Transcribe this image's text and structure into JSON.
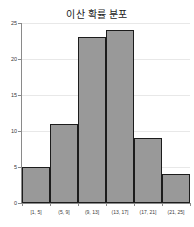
{
  "chart_data": {
    "type": "bar",
    "title": "이산 확률 분포",
    "xlabel": "",
    "ylabel": "",
    "categories": [
      "[1, 5]",
      "(5, 9]",
      "(9, 13]",
      "(13, 17]",
      "(17, 21]",
      "(21, 25]"
    ],
    "values": [
      5,
      11,
      23,
      24,
      9,
      4
    ],
    "ylim": [
      0,
      25
    ],
    "yticks": [
      0,
      5,
      10,
      15,
      20,
      25
    ],
    "ytick_labels": [
      "0",
      "5",
      "10",
      "15",
      "20",
      "25"
    ],
    "grid": true,
    "legend": null,
    "bar_color": "#999999",
    "bar_edge_color": "#1c1c1c",
    "grid_color": "#e8e8e8",
    "axis_color": "#8a8a8a",
    "background": "#ffffff"
  }
}
